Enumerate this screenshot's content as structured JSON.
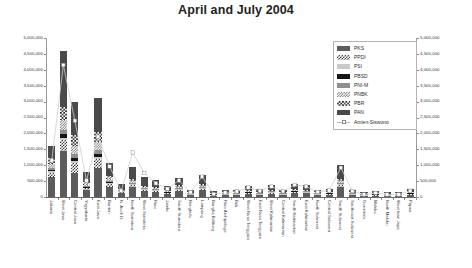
{
  "title": "April and July 2004",
  "legend": {
    "items": [
      {
        "label": "PKS",
        "swatch": "c-pks"
      },
      {
        "label": "PPDI",
        "swatch": "c-ppdi"
      },
      {
        "label": "PSI",
        "swatch": "c-psi"
      },
      {
        "label": "PBSD",
        "swatch": "c-pbsd"
      },
      {
        "label": "PNI-M",
        "swatch": "c-pnim"
      },
      {
        "label": "PNBK",
        "swatch": "c-pnbk"
      },
      {
        "label": "PBR",
        "swatch": "c-pbr"
      },
      {
        "label": "PAN",
        "swatch": "c-pan"
      },
      {
        "label": "Amien-Siswono",
        "swatch": "line"
      }
    ]
  },
  "chart_data": {
    "type": "bar",
    "title": "April and July 2004",
    "xlabel": "",
    "ylabel": "",
    "ylim": [
      0,
      5000000
    ],
    "grid": false,
    "legend_position": "top-right",
    "stacked": true,
    "dual_axis": true,
    "ytick_labels": [
      "0",
      "500,000",
      "1,000,000",
      "1,500,000",
      "2,000,000",
      "2,500,000",
      "3,000,000",
      "3,500,000",
      "4,000,000",
      "4,500,000",
      "5,000,000"
    ],
    "ytick_values": [
      0,
      500000,
      1000000,
      1500000,
      2000000,
      2500000,
      3000000,
      3500000,
      4000000,
      4500000,
      5000000
    ],
    "categories": [
      "Jakarta",
      "West Java",
      "Central Java",
      "Yogyakarta",
      "East Java",
      "Banten",
      "N. Aceh D.",
      "North Sumatera",
      "West Sumatera",
      "Riau",
      "Jambi",
      "South Sumatera",
      "Bengkulu",
      "Lampung",
      "Bangka Belitung",
      "Riau Archipelago",
      "Bali",
      "West Nusa Tenggara",
      "East Nusa Tenggara",
      "West Kalimantan",
      "Central Kalimantan",
      "South Kalimantan",
      "East Kalimantan",
      "North Sulawesi",
      "Central Sulawesi",
      "South Sulawesi",
      "Southeast Sulawesi",
      "Gorontalo",
      "Maluku",
      "North Maluku",
      "West Irian Jaya",
      "Papua"
    ],
    "series": [
      {
        "name": "PKS",
        "values": [
          620000,
          1450000,
          760000,
          210000,
          900000,
          330000,
          140000,
          330000,
          200000,
          170000,
          100000,
          185000,
          60000,
          215000,
          35000,
          55000,
          60000,
          95000,
          60000,
          110000,
          60000,
          125000,
          115000,
          55000,
          70000,
          320000,
          60000,
          25000,
          45000,
          25000,
          25000,
          70000
        ]
      },
      {
        "name": "PPDI",
        "values": [
          150000,
          330000,
          300000,
          60000,
          290000,
          80000,
          20000,
          55000,
          35000,
          30000,
          20000,
          40000,
          12000,
          45000,
          8000,
          10000,
          14000,
          20000,
          16000,
          24000,
          14000,
          28000,
          22000,
          12000,
          16000,
          60000,
          14000,
          6000,
          10000,
          6000,
          6000,
          14000
        ]
      },
      {
        "name": "PSI",
        "values": [
          40000,
          80000,
          70000,
          18000,
          70000,
          22000,
          8000,
          16000,
          10000,
          9000,
          6000,
          12000,
          4000,
          13000,
          3000,
          3000,
          5000,
          7000,
          5000,
          8000,
          5000,
          9000,
          7000,
          4000,
          5000,
          18000,
          5000,
          2000,
          4000,
          2000,
          2000,
          5000
        ]
      },
      {
        "name": "PBSD",
        "values": [
          55000,
          120000,
          105000,
          24000,
          100000,
          30000,
          10000,
          22000,
          14000,
          12000,
          8000,
          16000,
          5000,
          18000,
          4000,
          4000,
          6000,
          9000,
          7000,
          11000,
          6000,
          12000,
          10000,
          5000,
          7000,
          24000,
          6000,
          3000,
          5000,
          3000,
          3000,
          6000
        ]
      },
      {
        "name": "PNI-M",
        "values": [
          60000,
          140000,
          120000,
          28000,
          115000,
          34000,
          12000,
          26000,
          16000,
          14000,
          9000,
          19000,
          6000,
          21000,
          4000,
          5000,
          7000,
          10000,
          8000,
          12000,
          7000,
          14000,
          11000,
          6000,
          8000,
          28000,
          7000,
          3000,
          5000,
          3000,
          3000,
          7000
        ]
      },
      {
        "name": "PNBK",
        "values": [
          130000,
          300000,
          255000,
          55000,
          250000,
          70000,
          20000,
          50000,
          32000,
          28000,
          18000,
          38000,
          11000,
          42000,
          8000,
          9000,
          13000,
          19000,
          15000,
          23000,
          13000,
          26000,
          21000,
          11000,
          15000,
          55000,
          13000,
          6000,
          9000,
          6000,
          6000,
          13000
        ]
      },
      {
        "name": "PBR",
        "values": [
          170000,
          420000,
          340000,
          70000,
          330000,
          95000,
          28000,
          66000,
          42000,
          36000,
          24000,
          50000,
          15000,
          55000,
          10000,
          12000,
          17000,
          25000,
          20000,
          30000,
          17000,
          34000,
          27000,
          14000,
          19000,
          72000,
          17000,
          8000,
          12000,
          8000,
          8000,
          17000
        ]
      },
      {
        "name": "PAN",
        "values": [
          380000,
          1760000,
          1050000,
          320000,
          1045000,
          400000,
          160000,
          380000,
          270000,
          210000,
          130000,
          240000,
          75000,
          270000,
          45000,
          65000,
          80000,
          130000,
          85000,
          145000,
          80000,
          165000,
          150000,
          70000,
          90000,
          420000,
          80000,
          35000,
          60000,
          35000,
          35000,
          90000
        ]
      }
    ],
    "line_series": {
      "name": "Amien-Siswono",
      "marker": "white-square",
      "values": [
        1150000,
        4150000,
        2400000,
        520000,
        1900000,
        960000,
        200000,
        1400000,
        760000,
        430000,
        260000,
        520000,
        150000,
        640000,
        95000,
        140000,
        175000,
        300000,
        195000,
        330000,
        180000,
        380000,
        330000,
        160000,
        205000,
        920000,
        185000,
        80000,
        130000,
        80000,
        80000,
        195000
      ]
    }
  }
}
